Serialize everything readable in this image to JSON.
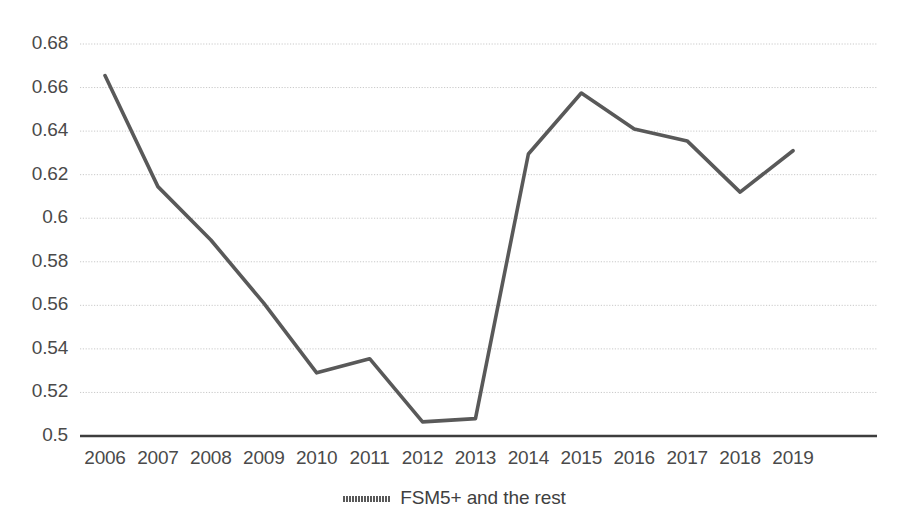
{
  "chart_data": {
    "type": "line",
    "title": "",
    "xlabel": "",
    "ylabel": "",
    "x": [
      2006,
      2007,
      2008,
      2009,
      2010,
      2011,
      2012,
      2013,
      2014,
      2015,
      2016,
      2017,
      2018,
      2019
    ],
    "categories": [
      "2006",
      "2007",
      "2008",
      "2009",
      "2010",
      "2011",
      "2012",
      "2013",
      "2014",
      "2015",
      "2016",
      "2017",
      "2018",
      "2019"
    ],
    "series": [
      {
        "name": "FSM5+ and the rest",
        "color": "#595959",
        "values": [
          0.6655,
          0.6145,
          0.59,
          0.561,
          0.529,
          0.5355,
          0.5065,
          0.508,
          0.6295,
          0.6575,
          0.641,
          0.6355,
          0.612,
          0.631
        ]
      }
    ],
    "ylim": [
      0.5,
      0.68
    ],
    "ytick_step": 0.02,
    "ytick_labels": [
      "0.68",
      "0.66",
      "0.64",
      "0.62",
      "0.6",
      "0.58",
      "0.56",
      "0.54",
      "0.52",
      "0.5"
    ],
    "ytick_values": [
      0.68,
      0.66,
      0.64,
      0.62,
      0.6,
      0.58,
      0.56,
      0.54,
      0.52,
      0.5
    ],
    "grid": true,
    "grid_style": "dotted",
    "grid_color": "#c9c9c9",
    "axis_color": "#3d3d3d",
    "legend_position": "bottom",
    "legend_entries": [
      "FSM5+ and the rest"
    ]
  },
  "legend": {
    "label": "FSM5+ and the rest"
  }
}
